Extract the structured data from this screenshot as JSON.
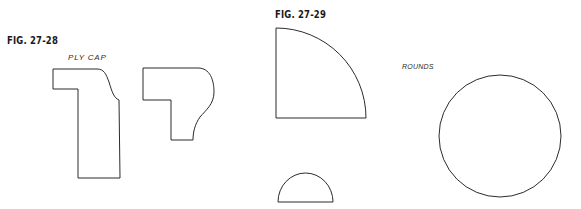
{
  "figures": [
    {
      "label": "FIG. 27-28",
      "caption": "PLY CAP",
      "shapes": [
        "ply-cap-profile-1",
        "ply-cap-profile-2"
      ]
    },
    {
      "label": "FIG. 27-29",
      "caption": "ROUNDS",
      "shapes": [
        "quarter-round",
        "half-round",
        "full-round"
      ]
    }
  ],
  "colors": {
    "line": "#2b2b2b",
    "text": "#1a1a1a",
    "background": "#ffffff"
  }
}
